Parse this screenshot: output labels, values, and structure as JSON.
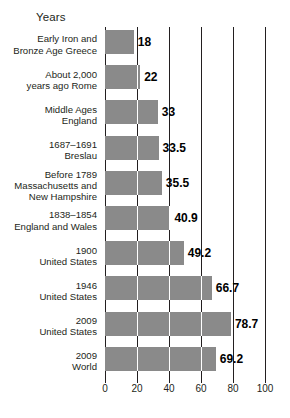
{
  "chart_data": {
    "type": "bar",
    "orientation": "horizontal",
    "title": "Years",
    "xlabel": "",
    "ylabel": "",
    "xlim": [
      0,
      100
    ],
    "xticks": [
      0,
      20,
      40,
      60,
      80,
      100
    ],
    "grid": true,
    "legend": null,
    "bar_color": "#8a8a8a",
    "categories": [
      "Early Iron and\nBronze Age Greece",
      "About 2,000\nyears ago Rome",
      "Middle Ages\nEngland",
      "1687–1691\nBreslau",
      "Before 1789\nMassachusetts and\nNew Hampshire",
      "1838–1854\nEngland and Wales",
      "1900\nUnited States",
      "1946\nUnited States",
      "2009\nUnited States",
      "2009\nWorld"
    ],
    "values": [
      18,
      22,
      33,
      33.5,
      35.5,
      40.9,
      49.2,
      66.7,
      78.7,
      69.2
    ],
    "value_labels": [
      "18",
      "22",
      "33",
      "33.5",
      "35.5",
      "40.9",
      "49.2",
      "66.7",
      "78.7",
      "69.2"
    ],
    "rows": [
      {
        "lines": [
          "Early Iron and",
          "Bronze Age Greece"
        ],
        "value": 18,
        "label": "18"
      },
      {
        "lines": [
          "About 2,000",
          "years ago Rome"
        ],
        "value": 22,
        "label": "22"
      },
      {
        "lines": [
          "Middle Ages",
          "England"
        ],
        "value": 33,
        "label": "33"
      },
      {
        "lines": [
          "1687–1691",
          "Breslau"
        ],
        "value": 33.5,
        "label": "33.5"
      },
      {
        "lines": [
          "Before 1789",
          "Massachusetts and",
          "New Hampshire"
        ],
        "value": 35.5,
        "label": "35.5"
      },
      {
        "lines": [
          "1838–1854",
          "England and Wales"
        ],
        "value": 40.9,
        "label": "40.9"
      },
      {
        "lines": [
          "1900",
          "United States"
        ],
        "value": 49.2,
        "label": "49.2"
      },
      {
        "lines": [
          "1946",
          "United States"
        ],
        "value": 66.7,
        "label": "66.7"
      },
      {
        "lines": [
          "2009",
          "United States"
        ],
        "value": 78.7,
        "label": "78.7"
      },
      {
        "lines": [
          "2009",
          "World"
        ],
        "value": 69.2,
        "label": "69.2"
      }
    ]
  }
}
